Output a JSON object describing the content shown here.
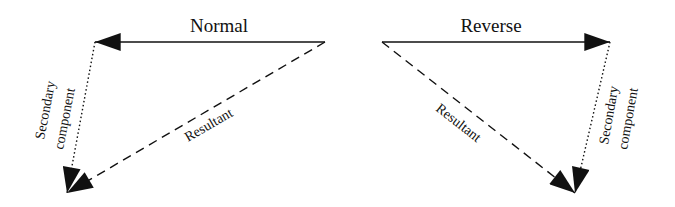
{
  "diagrams": [
    {
      "id": "normal",
      "title": "Normal",
      "primary_vector": {
        "from": [
          325,
          42
        ],
        "to": [
          95,
          42
        ],
        "style": "solid"
      },
      "secondary_vector": {
        "label_line1": "Secondary",
        "label_line2": "component",
        "from": [
          95,
          42
        ],
        "to": [
          67,
          193
        ],
        "style": "dotted"
      },
      "resultant_vector": {
        "label": "Resultant",
        "from": [
          325,
          42
        ],
        "to": [
          67,
          193
        ],
        "style": "dashed"
      }
    },
    {
      "id": "reverse",
      "title": "Reverse",
      "primary_vector": {
        "from": [
          382,
          42
        ],
        "to": [
          610,
          42
        ],
        "style": "solid"
      },
      "secondary_vector": {
        "label_line1": "Secondary",
        "label_line2": "component",
        "from": [
          610,
          42
        ],
        "to": [
          575,
          193
        ],
        "style": "dotted"
      },
      "resultant_vector": {
        "label": "Resultant",
        "from": [
          382,
          42
        ],
        "to": [
          575,
          193
        ],
        "style": "dashed"
      }
    }
  ],
  "colors": {
    "stroke": "#111111",
    "background": "#ffffff"
  }
}
